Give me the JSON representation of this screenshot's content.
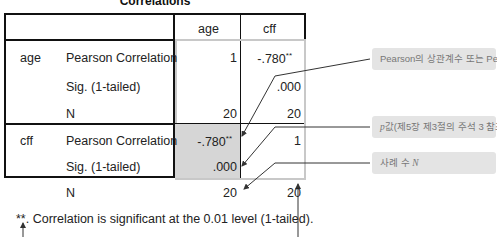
{
  "table": {
    "title": "Correlations",
    "columns": [
      "age",
      "cff"
    ],
    "rows": [
      {
        "variable": "age",
        "stats": [
          {
            "label": "Pearson Correlation",
            "age": "1",
            "cff": "-.780",
            "cff_mark": "**"
          },
          {
            "label": "Sig. (1-tailed)",
            "age": "",
            "cff": ".000"
          },
          {
            "label": "N",
            "age": "20",
            "cff": "20"
          }
        ]
      },
      {
        "variable": "cff",
        "stats": [
          {
            "label": "Pearson Correlation",
            "age": "-.780",
            "age_mark": "**",
            "cff": "1"
          },
          {
            "label": "Sig. (1-tailed)",
            "age": ".000",
            "cff": ""
          },
          {
            "label": "N",
            "age": "20",
            "cff": "20"
          }
        ]
      }
    ],
    "footnote": "**. Correlation is significant at the 0.01 level (1-tailed)."
  },
  "callouts": [
    {
      "text": "Pearson의 상관계수 또는 Pearson의 ",
      "italic": "r"
    },
    {
      "italic": "p",
      "text": "값(제5장 제3절의 주석 3 참조)"
    },
    {
      "text": "사례 수 ",
      "italic": "N"
    }
  ],
  "colors": {
    "shade": "#d6d6d6",
    "callout_bg": "#e4e4e4",
    "line": "#111111",
    "arrow": "#333333"
  }
}
